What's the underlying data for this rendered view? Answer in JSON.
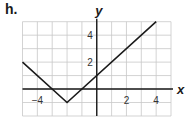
{
  "problem_label": "h.",
  "chart_data": {
    "type": "line",
    "title": "",
    "xlabel": "x",
    "ylabel": "y",
    "xlim": [
      -5,
      5
    ],
    "ylim": [
      -2,
      5
    ],
    "grid": true,
    "x_ticks_labeled": [
      -4,
      2,
      4
    ],
    "y_ticks_labeled": [
      2,
      4
    ],
    "x_tick_labels": [
      "−4",
      "2",
      "4"
    ],
    "y_tick_labels": [
      "2",
      "4"
    ],
    "series": [
      {
        "name": "y = |x + 2| - 1",
        "x": [
          -5,
          -2,
          4
        ],
        "y": [
          2,
          -1,
          5
        ]
      }
    ],
    "annotations": [],
    "legend": null,
    "colors": {
      "line": "#1a1a1a",
      "grid": "#c8c8c8",
      "axis": "#1a1a1a"
    }
  }
}
